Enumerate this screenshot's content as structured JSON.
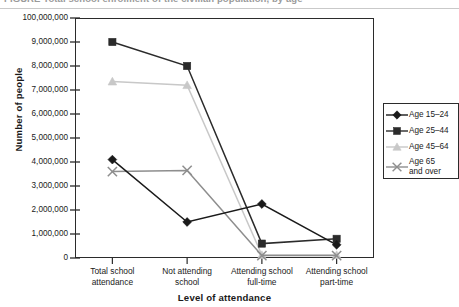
{
  "figure": {
    "title_fragment": "FIGURE  Total school enrolment of the civilian population, by age"
  },
  "chart_data": {
    "type": "line",
    "title": "",
    "xlabel": "Level of attendance",
    "ylabel": "Number of people",
    "categories": [
      "Total school\nattendance",
      "Not attending\nschool",
      "Attending school\nfull-time",
      "Attending school\npart-time"
    ],
    "ylim": [
      0,
      10000000
    ],
    "ytick_labels": [
      "100,000,000",
      "9,000,000",
      "8,000,000",
      "7,000,000",
      "6,000,000",
      "5,000,000",
      "4,000,000",
      "3,000,000",
      "2,000,000",
      "1,000,000",
      "0"
    ],
    "ytick_values": [
      10000000,
      9000000,
      8000000,
      7000000,
      6000000,
      5000000,
      4000000,
      3000000,
      2000000,
      1000000,
      0
    ],
    "grid": false,
    "legend_position": "right",
    "series": [
      {
        "name": "Age 15–24",
        "marker": "diamond",
        "color": "#1a1a1a",
        "values": [
          4100000,
          1500000,
          2250000,
          550000
        ]
      },
      {
        "name": "Age 25–44",
        "marker": "square",
        "color": "#2b2b2b",
        "values": [
          9000000,
          8000000,
          600000,
          800000
        ]
      },
      {
        "name": "Age 45–64",
        "marker": "triangle",
        "color": "#c8c8c8",
        "values": [
          7350000,
          7200000,
          120000,
          120000
        ]
      },
      {
        "name": "Age 65\nand over",
        "marker": "x",
        "color": "#8e8e8e",
        "values": [
          3600000,
          3650000,
          100000,
          100000
        ]
      }
    ]
  }
}
